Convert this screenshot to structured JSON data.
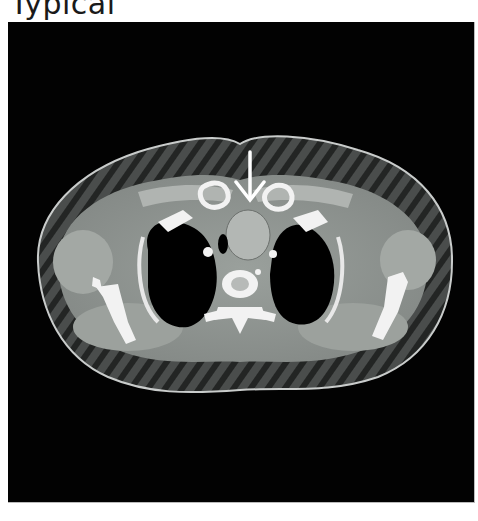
{
  "caption": "Typical",
  "image": {
    "modality": "axial CT",
    "annotation": "arrow-down",
    "colors": {
      "background": "#020202",
      "soft_tissue": "#8f9590",
      "muscle": "#9ea39f",
      "bone": "#f2f2f2",
      "air": "#000000",
      "arrow": "#ffffff"
    }
  }
}
